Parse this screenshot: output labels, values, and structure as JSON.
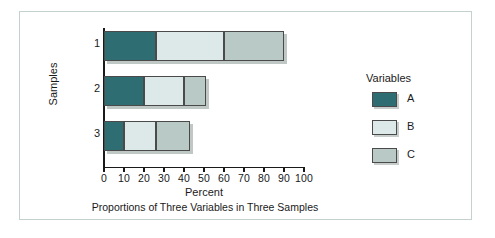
{
  "chart_data": {
    "type": "bar",
    "orientation": "horizontal",
    "stacked": true,
    "title": "",
    "caption": "Proportions of Three Variables in Three Samples",
    "xlabel": "Percent",
    "ylabel": "Samples",
    "categories": [
      "1",
      "2",
      "3"
    ],
    "xlim": [
      0,
      100
    ],
    "xticks": [
      0,
      10,
      20,
      30,
      40,
      50,
      60,
      70,
      80,
      90,
      100
    ],
    "xtick_labels": [
      "0",
      "10",
      "20",
      "30",
      "40",
      "50",
      "60",
      "70",
      "80",
      "90",
      "100"
    ],
    "grid": false,
    "legend": {
      "title": "Variables",
      "position": "right",
      "entries": [
        {
          "name": "A",
          "color": "#2e6d72"
        },
        {
          "name": "B",
          "color": "#dde8e8"
        },
        {
          "name": "C",
          "color": "#b9c9c6"
        }
      ]
    },
    "series": [
      {
        "name": "A",
        "color": "#2e6d72",
        "values": [
          26,
          20,
          10
        ]
      },
      {
        "name": "B",
        "color": "#dde8e8",
        "values": [
          34,
          20,
          16
        ]
      },
      {
        "name": "C",
        "color": "#b9c9c6",
        "values": [
          30,
          11,
          17
        ]
      }
    ],
    "totals": [
      90,
      51,
      43
    ],
    "segment_boundaries": {
      "1": [
        0,
        26,
        60,
        90
      ],
      "2": [
        0,
        20,
        40,
        51
      ],
      "3": [
        0,
        10,
        26,
        43
      ]
    }
  },
  "style": {
    "frame_color": "#c3d2ce",
    "axis_color": "#1a1a1a",
    "bar_border": "#4a4a4a",
    "background": "#ffffff"
  }
}
